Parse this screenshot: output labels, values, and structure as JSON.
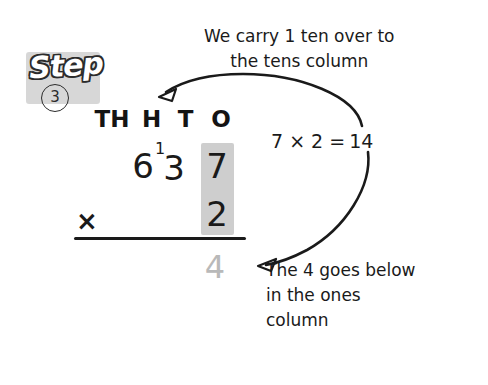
{
  "page": {
    "background_color": "#ffffff",
    "ink_color": "#1a1a1a",
    "highlight_color": "#bcbcbc",
    "faded_answer_color": "#b9b9b9"
  },
  "step": {
    "word": "Step",
    "number": "3"
  },
  "place_value_headers": [
    {
      "id": "th",
      "label": "TH"
    },
    {
      "id": "h",
      "label": "H"
    },
    {
      "id": "t",
      "label": "T"
    },
    {
      "id": "o",
      "label": "O"
    }
  ],
  "calculation": {
    "multiplicand": [
      "6",
      "3",
      "7"
    ],
    "carry_digit": "1",
    "operator": "×",
    "multiplier": "2",
    "partial_answer": "4"
  },
  "equation": {
    "expression": "7 × 2 =",
    "result": "14"
  },
  "annotations": {
    "top": [
      "We carry 1 ten over to",
      "the tens column"
    ],
    "bottom": [
      "The 4 goes below",
      "in the ones",
      "column"
    ]
  }
}
